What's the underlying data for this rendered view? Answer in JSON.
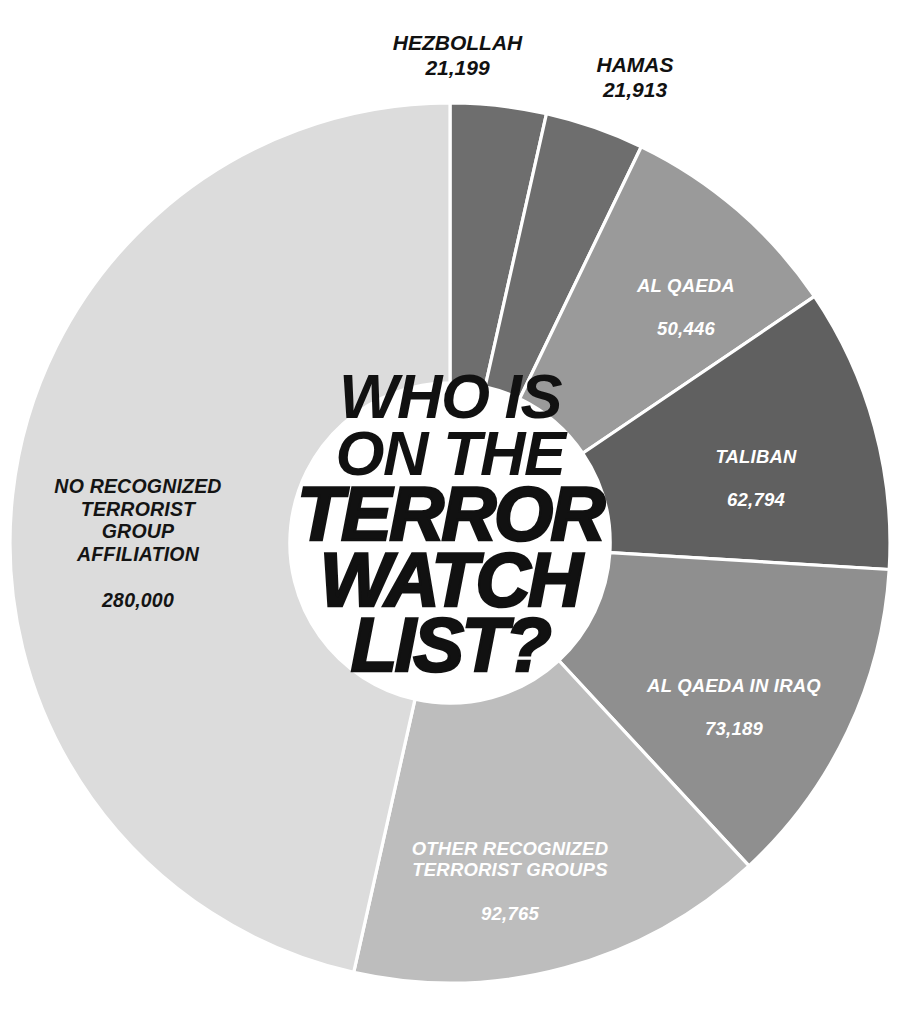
{
  "title": {
    "lines": [
      "WHO IS",
      "ON THE",
      "TERROR",
      "WATCH",
      "LIST?"
    ],
    "line_1": "WHO IS",
    "line_2": "ON THE",
    "line_3": "TERROR",
    "line_4": "WATCH",
    "line_5": "LIST?"
  },
  "source_note": "",
  "colors": {
    "background": "#ffffff",
    "separator": "#ffffff",
    "text_on_dark": "#ffffff",
    "text_on_light": "#141414",
    "title": "#111111",
    "hezbollah": "#6e6e6e",
    "hamas": "#6e6e6e",
    "al_qaeda": "#9a9a9a",
    "taliban": "#606060",
    "al_qaeda_iraq": "#8f8f8f",
    "other_recognized": "#bdbdbd",
    "no_affiliation": "#dcdcdc"
  },
  "chart_data": {
    "type": "pie",
    "variant": "donut",
    "title": "WHO IS ON THE TERROR WATCH LIST?",
    "xlabel": "",
    "ylabel": "",
    "legend": "none",
    "grid": false,
    "total": 602306,
    "units": "people on watch list",
    "start_angle_deg": 0,
    "direction": "clockwise",
    "inner_radius_ratio": 0.364,
    "categories": [
      "HEZBOLLAH",
      "HAMAS",
      "AL QAEDA",
      "TALIBAN",
      "AL QAEDA IN IRAQ",
      "OTHER RECOGNIZED TERRORIST GROUPS",
      "NO RECOGNIZED TERRORIST GROUP AFFILIATION"
    ],
    "values": [
      21199,
      21913,
      50446,
      62794,
      73189,
      92765,
      280000
    ],
    "value_labels": [
      "21,199",
      "21,913",
      "50,446",
      "62,794",
      "73,189",
      "92,765",
      "280,000"
    ],
    "slices": [
      {
        "name": "HEZBOLLAH",
        "label_lines": [
          "HEZBOLLAH"
        ],
        "value": 21199,
        "value_label": "21,199",
        "percent": 3.5,
        "color": "#6e6e6e",
        "label_placement": "callout-outside",
        "label_color": "#111111"
      },
      {
        "name": "HAMAS",
        "label_lines": [
          "HAMAS"
        ],
        "value": 21913,
        "value_label": "21,913",
        "percent": 3.6,
        "color": "#6e6e6e",
        "label_placement": "callout-outside",
        "label_color": "#111111"
      },
      {
        "name": "AL QAEDA",
        "label_lines": [
          "AL QAEDA"
        ],
        "value": 50446,
        "value_label": "50,446",
        "percent": 8.4,
        "color": "#9a9a9a",
        "label_placement": "inside",
        "label_color": "#ffffff"
      },
      {
        "name": "TALIBAN",
        "label_lines": [
          "TALIBAN"
        ],
        "value": 62794,
        "value_label": "62,794",
        "percent": 10.4,
        "color": "#606060",
        "label_placement": "inside",
        "label_color": "#ffffff"
      },
      {
        "name": "AL QAEDA IN IRAQ",
        "label_lines": [
          "AL QAEDA IN IRAQ"
        ],
        "value": 73189,
        "value_label": "73,189",
        "percent": 12.2,
        "color": "#8f8f8f",
        "label_placement": "inside",
        "label_color": "#ffffff"
      },
      {
        "name": "OTHER RECOGNIZED TERRORIST GROUPS",
        "label_lines": [
          "OTHER RECOGNIZED",
          "TERRORIST GROUPS"
        ],
        "value": 92765,
        "value_label": "92,765",
        "percent": 15.4,
        "color": "#bdbdbd",
        "label_placement": "inside",
        "label_color": "#ffffff"
      },
      {
        "name": "NO RECOGNIZED TERRORIST GROUP AFFILIATION",
        "label_lines": [
          "NO RECOGNIZED",
          "TERRORIST",
          "GROUP",
          "AFFILIATION"
        ],
        "value": 280000,
        "value_label": "280,000",
        "percent": 46.5,
        "color": "#dcdcdc",
        "label_placement": "inside",
        "label_color": "#141414"
      }
    ]
  },
  "labels": {
    "hezbollah": {
      "name": "HEZBOLLAH",
      "value": "21,199"
    },
    "hamas": {
      "name": "HAMAS",
      "value": "21,913"
    },
    "al_qaeda": {
      "name": "AL QAEDA",
      "value": "50,446"
    },
    "taliban": {
      "name": "TALIBAN",
      "value": "62,794"
    },
    "al_qaeda_iraq": {
      "name": "AL QAEDA IN IRAQ",
      "value": "73,189"
    },
    "other_recognized": {
      "name": "OTHER RECOGNIZED\nTERRORIST GROUPS",
      "value": "92,765"
    },
    "no_affiliation": {
      "name": "NO RECOGNIZED\nTERRORIST\nGROUP\nAFFILIATION",
      "value": "280,000"
    }
  }
}
